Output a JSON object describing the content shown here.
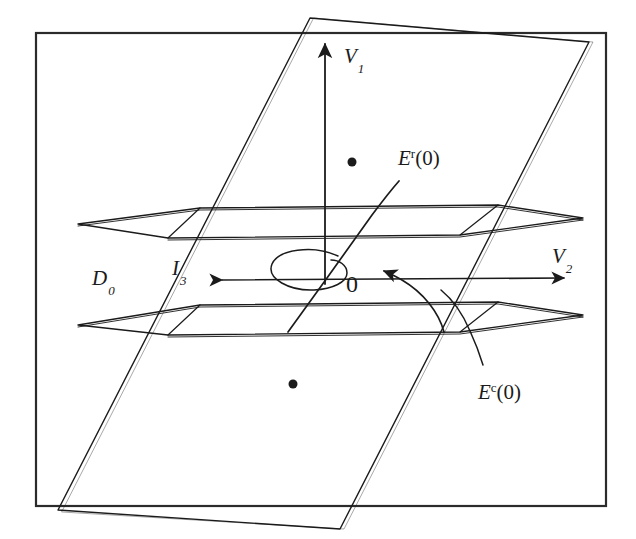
{
  "figure": {
    "background_color": "#ffffff",
    "stroke_color": "#1b1b1b",
    "frame": {
      "name": "figure-border",
      "x": 36,
      "y": 33,
      "width": 570,
      "height": 473
    },
    "labels": [
      {
        "id": "v1",
        "base": "V",
        "sub": "1",
        "sup": "",
        "suffix": "",
        "x": 344,
        "y": 46,
        "meaning": "vertical axis V1"
      },
      {
        "id": "v2",
        "base": "V",
        "sub": "2",
        "sup": "",
        "suffix": "",
        "x": 552,
        "y": 246,
        "meaning": "horizontal axis V2"
      },
      {
        "id": "d0",
        "base": "D",
        "sub": "0",
        "sup": "",
        "suffix": "",
        "x": 92,
        "y": 268,
        "meaning": "domain D0"
      },
      {
        "id": "i3",
        "base": "I",
        "sub": "3",
        "sup": "",
        "suffix": "",
        "x": 172,
        "y": 258,
        "meaning": "interval I3"
      },
      {
        "id": "er0",
        "base": "E",
        "sub": "",
        "sup": "r",
        "suffix": "(0)",
        "x": 398,
        "y": 148,
        "meaning": "repelling eigenspace E^r(0)"
      },
      {
        "id": "ec0",
        "base": "E",
        "sub": "",
        "sup": "c",
        "suffix": "(0)",
        "x": 478,
        "y": 382,
        "meaning": "center eigenspace E^c(0)"
      }
    ],
    "origin_label": {
      "id": "origin",
      "text": "0",
      "x": 346,
      "y": 272
    },
    "dots": [
      {
        "id": "upper-dot",
        "cx": 352,
        "cy": 162,
        "r": 4.5
      },
      {
        "id": "lower-dot",
        "cx": 293,
        "cy": 384,
        "r": 4.5
      }
    ],
    "axes": [
      {
        "id": "v1-axis",
        "from": [
          325,
          282
        ],
        "to": [
          325,
          38
        ],
        "arrow": "end",
        "description": "vertical V1 axis arrow pointing up"
      },
      {
        "id": "v2-axis",
        "from": [
          212,
          278
        ],
        "to": [
          572,
          278
        ],
        "arrow": "both",
        "description": "horizontal V2 axis with arrowheads at both ends"
      }
    ],
    "slanted_plane": {
      "id": "d0-plane",
      "points": "310,18 589,42 340,529 58,510",
      "description": "large slanted parallelogram plane D0"
    },
    "upper_plane": {
      "id": "upper-boundary-plane",
      "outer": "78,224 200,208 498,205 583,218 460,235 168,238",
      "description": "upper horizontal boundary plane of the slab"
    },
    "lower_plane": {
      "id": "lower-boundary-plane",
      "outer": "78,325 200,305 498,302 583,315 460,332 168,335",
      "description": "lower horizontal boundary plane of the slab"
    },
    "curves": [
      {
        "id": "er-curve",
        "d": "M 288,330 L 330,272 L 372,213 C 385,198 392,188 399,180",
        "description": "E^r(0) nearly straight curve through origin rising to upper right"
      },
      {
        "id": "ec-curve",
        "d": "M 440,292 C 452,300 462,312 470,330 C 476,343 480,354 483,364",
        "description": "E^c(0) short curve near right side of slab"
      },
      {
        "id": "spiral",
        "d": "M 333,258 C 306,248 276,254 272,266 C 268,278 288,288 310,288 C 330,288 344,282 345,274 C 346,266 338,261 330,261",
        "description": "small spiral / ellipse loop around origin"
      },
      {
        "id": "flow-arrow",
        "d": "M 443,330 C 438,312 424,292 400,278 C 392,273 386,270 380,268",
        "arrow": "end",
        "description": "curved flow arrow pointing toward origin"
      }
    ]
  }
}
